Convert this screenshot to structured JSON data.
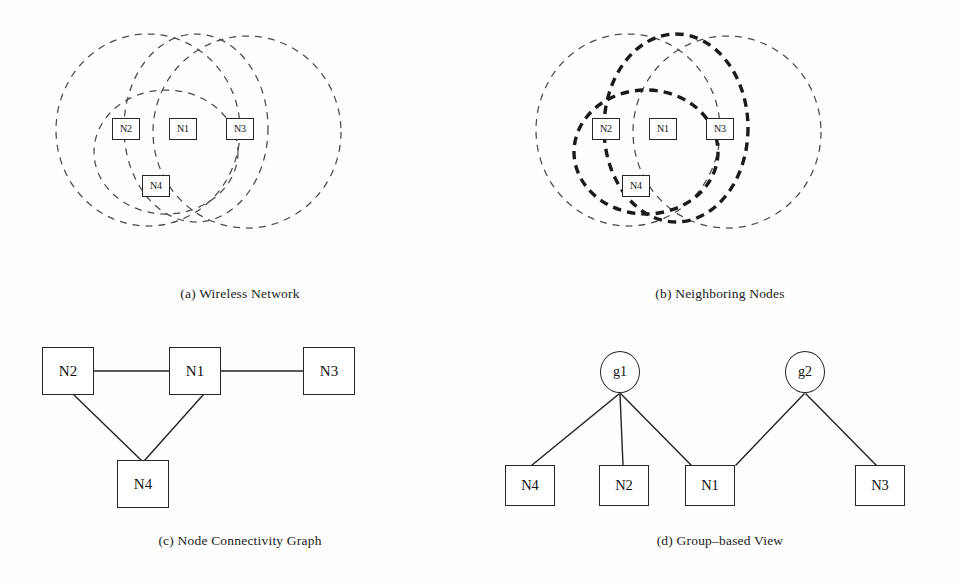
{
  "figure": {
    "background_color": "#ffffff",
    "ink_color": "#222222",
    "dashed_stroke_color": "#4a4a4a",
    "bold_stroke_color": "#1a1a1a"
  },
  "panels": [
    {
      "id": "a",
      "caption": "(a) Wireless Network",
      "kind": "range-circles",
      "description": "Four nodes with dashed transmission range circles",
      "nodes": [
        {
          "label": "N2",
          "x": 126,
          "y": 129
        },
        {
          "label": "N1",
          "x": 183,
          "y": 129
        },
        {
          "label": "N3",
          "x": 240,
          "y": 129
        },
        {
          "label": "N4",
          "x": 156,
          "y": 186
        }
      ],
      "circles": [
        {
          "owner": "N2",
          "cx": 148,
          "cy": 130,
          "rx": 92,
          "ry": 96,
          "bold": false
        },
        {
          "owner": "N1",
          "cx": 196,
          "cy": 128,
          "rx": 72,
          "ry": 94,
          "bold": false
        },
        {
          "owner": "N3",
          "cx": 247,
          "cy": 132,
          "rx": 94,
          "ry": 96,
          "bold": false
        },
        {
          "owner": "N4",
          "cx": 166,
          "cy": 152,
          "rx": 72,
          "ry": 62,
          "bold": false
        }
      ]
    },
    {
      "id": "b",
      "caption": "(b) Neighboring Nodes",
      "kind": "range-circles",
      "description": "Same topology with two highlighted (bold) range circles forming the groups",
      "nodes": [
        {
          "label": "N2",
          "x": 126,
          "y": 129
        },
        {
          "label": "N1",
          "x": 183,
          "y": 129
        },
        {
          "label": "N3",
          "x": 240,
          "y": 129
        },
        {
          "label": "N4",
          "x": 156,
          "y": 186
        }
      ],
      "circles": [
        {
          "owner": "N2",
          "cx": 148,
          "cy": 130,
          "rx": 92,
          "ry": 96,
          "bold": false
        },
        {
          "owner": "N1",
          "cx": 196,
          "cy": 128,
          "rx": 72,
          "ry": 94,
          "bold": true
        },
        {
          "owner": "N3",
          "cx": 247,
          "cy": 132,
          "rx": 94,
          "ry": 96,
          "bold": false
        },
        {
          "owner": "N4",
          "cx": 166,
          "cy": 152,
          "rx": 72,
          "ry": 62,
          "bold": true
        }
      ]
    },
    {
      "id": "c",
      "caption": "(c) Node Connectivity Graph",
      "kind": "graph",
      "description": "Undirected connectivity graph between the four nodes",
      "nodes": [
        {
          "label": "N2",
          "x": 68,
          "y": 61
        },
        {
          "label": "N1",
          "x": 195,
          "y": 61
        },
        {
          "label": "N3",
          "x": 329,
          "y": 61
        },
        {
          "label": "N4",
          "x": 143,
          "y": 171
        }
      ],
      "edges": [
        {
          "from": "N2",
          "to": "N1"
        },
        {
          "from": "N1",
          "to": "N3"
        },
        {
          "from": "N2",
          "to": "N4"
        },
        {
          "from": "N1",
          "to": "N4"
        }
      ]
    },
    {
      "id": "d",
      "caption": "(d) Group–based View",
      "kind": "group-tree",
      "description": "Bipartite group membership view: groups g1 and g2 over nodes",
      "groups": [
        {
          "label": "g1",
          "x": 140,
          "y": 62,
          "members": [
            "N4",
            "N2",
            "N1"
          ]
        },
        {
          "label": "g2",
          "x": 325,
          "y": 62,
          "members": [
            "N1",
            "N3"
          ]
        }
      ],
      "nodes": [
        {
          "label": "N4",
          "x": 50,
          "y": 175
        },
        {
          "label": "N2",
          "x": 144,
          "y": 175
        },
        {
          "label": "N1",
          "x": 230,
          "y": 175
        },
        {
          "label": "N3",
          "x": 400,
          "y": 175
        }
      ],
      "edges": [
        {
          "from": "g1",
          "to": "N4"
        },
        {
          "from": "g1",
          "to": "N2"
        },
        {
          "from": "g1",
          "to": "N1"
        },
        {
          "from": "g2",
          "to": "N1"
        },
        {
          "from": "g2",
          "to": "N3"
        }
      ]
    }
  ],
  "labels": {
    "n1": "N1",
    "n2": "N2",
    "n3": "N3",
    "n4": "N4",
    "g1": "g1",
    "g2": "g2"
  }
}
